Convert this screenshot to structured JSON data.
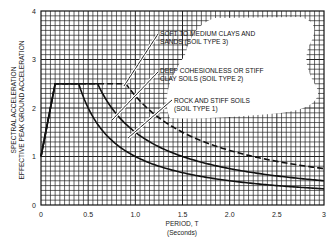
{
  "chart_data": {
    "type": "line",
    "title": "",
    "xlabel": "PERIOD, T",
    "xlabel_sub": "(Seconds)",
    "ylabel_line1": "SPECTRAL ACCELERATION",
    "ylabel_line2": "EFFECTIVE PEAK GROUND ACCELERATION",
    "xlim": [
      0,
      3
    ],
    "ylim": [
      0,
      4
    ],
    "x_ticks": [
      0,
      0.5,
      1.0,
      1.5,
      2.0,
      2.5,
      3
    ],
    "x_tick_labels": [
      "0",
      "0.5",
      "1.0",
      "1.5",
      "2.0",
      "2.5",
      "3"
    ],
    "y_ticks": [
      0,
      1,
      2,
      3,
      4
    ],
    "y_tick_labels": [
      "0",
      "1",
      "2",
      "3",
      "4"
    ],
    "grid": true,
    "series": [
      {
        "name": "Rock and stiff soils (Soil Type 1)",
        "style": "solid",
        "x": [
          0,
          0.15,
          0.4,
          0.6,
          0.8,
          1.0,
          1.5,
          2.0,
          2.5,
          3.0
        ],
        "y": [
          1.0,
          2.5,
          2.5,
          1.67,
          1.25,
          1.0,
          0.67,
          0.5,
          0.4,
          0.33
        ]
      },
      {
        "name": "Deep cohesionless or stiff clay soils (Soil Type 2)",
        "style": "solid",
        "x": [
          0,
          0.15,
          0.6,
          0.8,
          1.0,
          1.5,
          2.0,
          2.5,
          3.0
        ],
        "y": [
          1.0,
          2.5,
          2.5,
          1.88,
          1.5,
          1.0,
          0.75,
          0.6,
          0.5
        ]
      },
      {
        "name": "Soft to medium clays and sands (Soil Type 3)",
        "style": "dashed",
        "x": [
          0,
          0.15,
          0.9,
          1.0,
          1.25,
          1.5,
          2.0,
          2.5,
          3.0
        ],
        "y": [
          1.0,
          2.5,
          2.5,
          2.26,
          1.8,
          1.5,
          1.13,
          0.9,
          0.75
        ]
      }
    ],
    "annotations": [
      {
        "line1": "SOFT TO MEDIUM CLAYS AND",
        "line2": "SANDS (SOIL TYPE 3)"
      },
      {
        "line1": "DEEP COHESIONLESS OR STIFF",
        "line2": "CLAY SOILS (SOIL TYPE 2)"
      },
      {
        "line1": "ROCK AND STIFF SOILS",
        "line2": "(SOIL TYPE 1)"
      }
    ]
  }
}
